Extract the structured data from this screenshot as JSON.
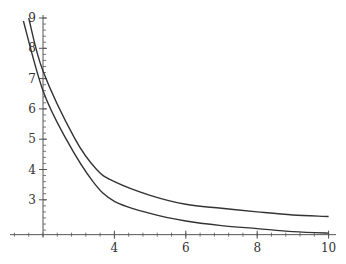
{
  "chart_data": {
    "type": "line",
    "title": "",
    "xlabel": "",
    "ylabel": "",
    "xlim": [
      1.0,
      10.2
    ],
    "ylim": [
      1.85,
      9.0
    ],
    "axes_origin": {
      "x": 2,
      "y": 1.85
    },
    "grid": false,
    "legend": null,
    "x_ticks": [
      4,
      6,
      8,
      10
    ],
    "y_ticks": [
      3,
      4,
      5,
      6,
      7,
      8,
      9
    ],
    "x_tick_labels": [
      "4",
      "6",
      "8",
      "10"
    ],
    "y_tick_labels": [
      "3",
      "4",
      "5",
      "6",
      "7",
      "8",
      "9"
    ],
    "x_minor_step": 0.4,
    "y_minor_step": 0.2,
    "series": [
      {
        "name": "upper curve",
        "color": "#333333",
        "x": [
          1.6,
          2.0,
          2.9,
          3.5,
          4.0,
          5.0,
          6.0,
          7.0,
          8.0,
          9.0,
          10.0
        ],
        "y": [
          9.0,
          7.25,
          5.0,
          4.0,
          3.6,
          3.15,
          2.85,
          2.72,
          2.6,
          2.5,
          2.45
        ]
      },
      {
        "name": "lower curve",
        "color": "#333333",
        "x": [
          1.45,
          2.0,
          2.65,
          3.4,
          4.0,
          5.0,
          6.0,
          7.0,
          8.0,
          9.0,
          10.0
        ],
        "y": [
          8.9,
          6.6,
          5.0,
          3.6,
          2.95,
          2.55,
          2.3,
          2.15,
          2.05,
          1.95,
          1.9
        ]
      }
    ]
  }
}
